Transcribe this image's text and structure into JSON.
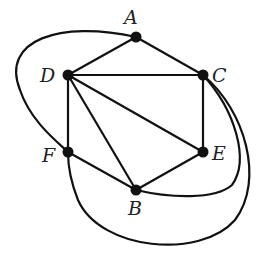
{
  "diagram": {
    "type": "graph",
    "vertices": [
      {
        "id": "A",
        "label": "A",
        "x": 136,
        "y": 37,
        "lx": 124,
        "ly": 24
      },
      {
        "id": "D",
        "label": "D",
        "x": 68,
        "y": 75,
        "lx": 40,
        "ly": 82
      },
      {
        "id": "C",
        "label": "C",
        "x": 203,
        "y": 75,
        "lx": 212,
        "ly": 82
      },
      {
        "id": "F",
        "label": "F",
        "x": 68,
        "y": 152,
        "lx": 42,
        "ly": 162
      },
      {
        "id": "E",
        "label": "E",
        "x": 203,
        "y": 152,
        "lx": 212,
        "ly": 160
      },
      {
        "id": "B",
        "label": "B",
        "x": 136,
        "y": 190,
        "lx": 128,
        "ly": 215
      }
    ],
    "straight_edges": [
      [
        "A",
        "D"
      ],
      [
        "A",
        "C"
      ],
      [
        "D",
        "C"
      ],
      [
        "D",
        "F"
      ],
      [
        "D",
        "B"
      ],
      [
        "D",
        "E"
      ],
      [
        "C",
        "E"
      ],
      [
        "F",
        "B"
      ],
      [
        "B",
        "E"
      ]
    ],
    "curved_edges": [
      {
        "from": "A",
        "to": "F",
        "path": "M136,37 C60,20 0,40 20,90 C30,120 55,140 68,152"
      },
      {
        "from": "C",
        "to": "B",
        "path": "M203,75 C235,110 250,160 232,185 C215,200 170,198 136,190"
      },
      {
        "from": "C",
        "to": "F",
        "path": "M203,75 C245,110 265,180 235,220 C200,260 100,250 78,200 C70,180 68,165 68,152"
      }
    ]
  }
}
